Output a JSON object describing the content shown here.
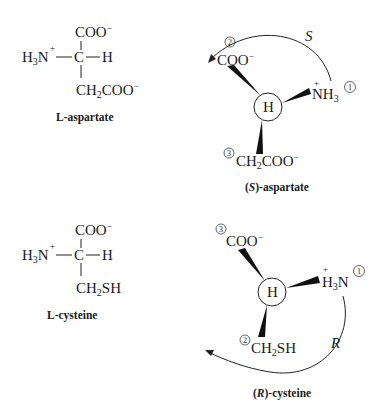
{
  "figure": {
    "panels": [
      {
        "id": "l-aspartate",
        "type": "fischer-projection",
        "label": "L-aspartate",
        "top": "COO",
        "top_charge": "−",
        "left": "H3N",
        "left_charge": "+",
        "center": "C",
        "right": "H",
        "bottom": "CH2COO",
        "bottom_charge": "−"
      },
      {
        "id": "s-aspartate",
        "type": "wedge-projection",
        "label_prefix": "(",
        "label_config": "S",
        "label_suffix": ")-aspartate",
        "center": "H",
        "rotation_label": "S",
        "substituents": [
          {
            "priority": "1",
            "group": "NH3",
            "charge": "+"
          },
          {
            "priority": "2",
            "group": "COO",
            "charge": "−"
          },
          {
            "priority": "3",
            "group": "CH2COO",
            "charge": "−"
          }
        ]
      },
      {
        "id": "l-cysteine",
        "type": "fischer-projection",
        "label": "L-cysteine",
        "top": "COO",
        "top_charge": "−",
        "left": "H3N",
        "left_charge": "+",
        "center": "C",
        "right": "H",
        "bottom": "CH2SH"
      },
      {
        "id": "r-cysteine",
        "type": "wedge-projection",
        "label_prefix": "(",
        "label_config": "R",
        "label_suffix": ")-cysteine",
        "center": "H",
        "rotation_label": "R",
        "substituents": [
          {
            "priority": "1",
            "group": "H3N",
            "charge": "+"
          },
          {
            "priority": "2",
            "group": "CH2SH",
            "charge": ""
          },
          {
            "priority": "3",
            "group": "COO",
            "charge": "−"
          }
        ]
      }
    ],
    "text": {
      "C": "C",
      "H": "H",
      "N": "N",
      "COO": "COO",
      "CH": "CH",
      "SH": "SH",
      "sub2": "2",
      "sub3": "3",
      "minus": "−",
      "plus": "+",
      "one": "1",
      "two": "2",
      "three": "3",
      "S": "S",
      "R": "R",
      "l_aspartate": "L-aspartate",
      "l_cysteine": "L-cysteine",
      "open_paren": "(",
      "aspartate_suffix": ")-aspartate",
      "cysteine_suffix": ")-cysteine"
    }
  }
}
